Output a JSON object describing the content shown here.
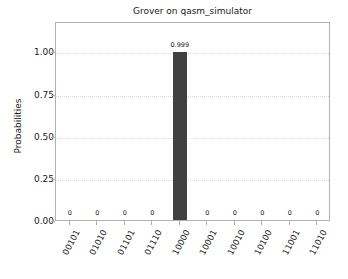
{
  "chart_data": {
    "type": "bar",
    "title": "Grover on qasm_simulator",
    "xlabel": "",
    "ylabel": "Probabilities",
    "categories": [
      "00101",
      "01010",
      "01101",
      "01110",
      "10000",
      "10001",
      "10010",
      "10100",
      "11001",
      "11010"
    ],
    "values": [
      0,
      0,
      0,
      0,
      0.999,
      0,
      0,
      0,
      0,
      0
    ],
    "bar_labels": [
      "0",
      "0",
      "0",
      "0",
      "0.999",
      "0",
      "0",
      "0",
      "0",
      "0"
    ],
    "ylim": [
      0.0,
      1.18
    ],
    "yticks": [
      0.0,
      0.25,
      0.5,
      0.75,
      1.0
    ],
    "ytick_labels": [
      "0.00",
      "0.25",
      "0.50",
      "0.75",
      "1.00"
    ],
    "grid": true,
    "grid_axis": "y",
    "legend": false,
    "bar_color": "#404040",
    "grid_color": "#d9d9d9",
    "axis_color": "#b0b0b0",
    "background": "#ffffff"
  }
}
